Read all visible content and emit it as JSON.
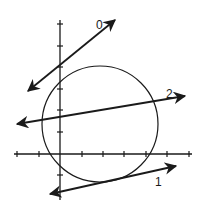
{
  "diagram": {
    "colors": {
      "stroke": "#1a1a1a",
      "background": "#ffffff"
    },
    "axes": {
      "x_ticks": [
        17,
        39,
        82,
        103,
        124,
        146,
        167,
        189
      ],
      "y_ticks": [
        24,
        46,
        67,
        89,
        110,
        132,
        175
      ]
    },
    "circle": {
      "cx": 100,
      "cy": 124,
      "r": 58
    },
    "lines": [
      {
        "label": "0",
        "x1": 28,
        "y1": 91,
        "x2": 115,
        "y2": 20
      },
      {
        "label": "1",
        "x1": 50,
        "y1": 194,
        "x2": 176,
        "y2": 166
      },
      {
        "label": "2",
        "x1": 17,
        "y1": 124,
        "x2": 185,
        "y2": 96
      }
    ],
    "labels": {
      "line0": "0",
      "line1": "1",
      "line2": "2"
    }
  }
}
